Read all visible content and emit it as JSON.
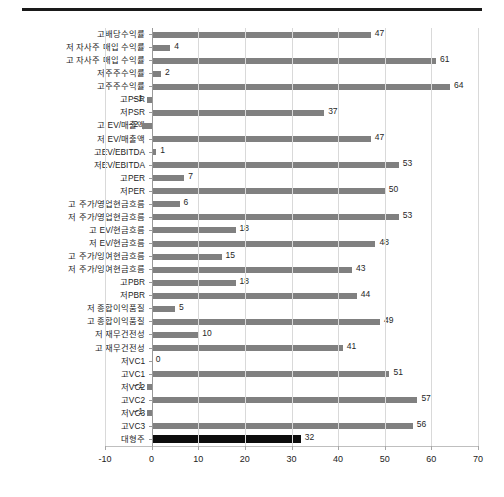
{
  "figure": {
    "top_rule": true,
    "background_color": "#ffffff"
  },
  "chart_data": {
    "type": "bar",
    "orientation": "horizontal",
    "title": "",
    "subtitle": "",
    "xlabel": "",
    "ylabel": "",
    "xlim": [
      -10,
      70
    ],
    "xticks": [
      -10,
      0,
      10,
      20,
      30,
      40,
      50,
      60,
      70
    ],
    "xtick_labels": [
      "-10",
      "0",
      "10",
      "20",
      "30",
      "40",
      "50",
      "60",
      "70"
    ],
    "grid": "vertical",
    "legend": null,
    "bar_color": "#808080",
    "highlight_color": "#0d0d0d",
    "highlight_category": "대형주",
    "categories": [
      "고배당수익률",
      "저 자사주 매입 수익률",
      "고 자사주 매입 수익률",
      "저주주수익률",
      "고주주수익률",
      "고PSR",
      "저PSR",
      "고 EV/매출액",
      "저 EV/매출액",
      "고EV/EBITDA",
      "저EV/EBITDA",
      "고PER",
      "저PER",
      "고 주가/영업현금흐름",
      "저 주가/영업현금흐름",
      "고 EV/현금흐름",
      "저 EV/현금흐름",
      "고 주가/잉여현금흐름",
      "저 주가/잉여현금흐름",
      "고PBR",
      "저PBR",
      "저 종합이익품질",
      "고 종합이익품질",
      "저 재무건전성",
      "고 재무건전성",
      "저VC1",
      "고VC1",
      "저VC2",
      "고VC2",
      "저VC3",
      "고VC3",
      "대형주"
    ],
    "values": [
      47,
      4,
      61,
      2,
      64,
      -1,
      37,
      -2,
      47,
      1,
      53,
      7,
      50,
      6,
      53,
      18,
      48,
      15,
      43,
      18,
      44,
      5,
      49,
      10,
      41,
      0,
      51,
      -1,
      57,
      -1,
      56,
      32
    ],
    "value_labels": [
      "47",
      "4",
      "61",
      "2",
      "64",
      "−1",
      "37",
      "−2",
      "47",
      "1",
      "53",
      "7",
      "50",
      "6",
      "53",
      "18",
      "48",
      "15",
      "43",
      "18",
      "44",
      "5",
      "49",
      "10",
      "41",
      "0",
      "51",
      "−1",
      "57",
      "−1",
      "56",
      "32"
    ]
  }
}
